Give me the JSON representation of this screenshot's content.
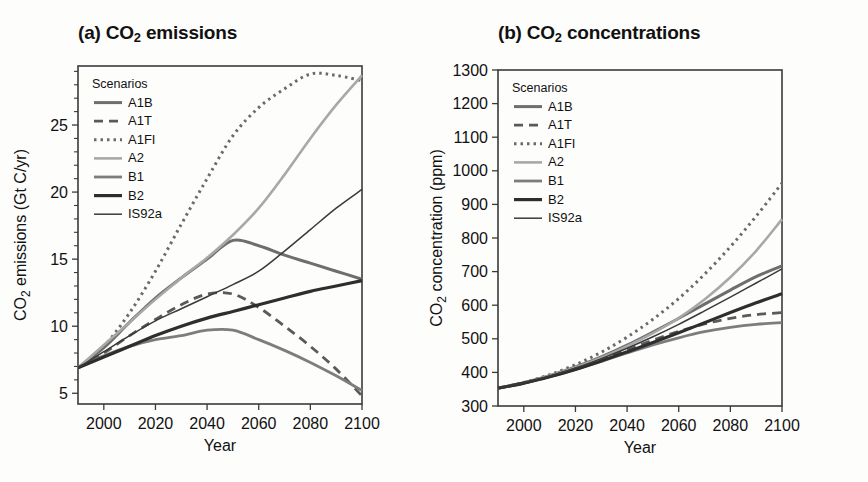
{
  "figure": {
    "background": "#fdfdfc",
    "panels": [
      {
        "id": "a",
        "title_prefix": "(a) CO",
        "title_sub": "2",
        "title_suffix": " emissions",
        "title_full": "(a) CO2 emissions",
        "legend_title": "Scenarios"
      },
      {
        "id": "b",
        "title_prefix": "(b) CO",
        "title_sub": "2",
        "title_suffix": " concentrations",
        "title_full": "(b) CO2 concentrations",
        "legend_title": "Scenarios"
      }
    ]
  },
  "scenarios": [
    {
      "name": "A1B",
      "color": "#6e6e6e",
      "width": 3.0,
      "dash": "none"
    },
    {
      "name": "A1T",
      "color": "#5a5a5a",
      "width": 2.8,
      "dash": "9,6"
    },
    {
      "name": "A1FI",
      "color": "#6a6a6a",
      "width": 3.0,
      "dash": "2.5,4"
    },
    {
      "name": "A2",
      "color": "#a8a8a8",
      "width": 2.6,
      "dash": "none"
    },
    {
      "name": "B1",
      "color": "#7d7d7d",
      "width": 2.8,
      "dash": "none"
    },
    {
      "name": "B2",
      "color": "#2e2e2e",
      "width": 3.2,
      "dash": "none"
    },
    {
      "name": "IS92a",
      "color": "#3a3a3a",
      "width": 1.5,
      "dash": "none"
    }
  ],
  "chart_data": [
    {
      "type": "line",
      "panel": "a",
      "title": "(a) CO2 emissions",
      "xlabel": "Year",
      "ylabel": "CO2 emissions (Gt C/yr)",
      "ylabel_prefix": "CO",
      "ylabel_sub": "2",
      "ylabel_suffix": " emissions (Gt C/yr)",
      "xlim": [
        1990,
        2100
      ],
      "ylim": [
        4.2,
        29.4
      ],
      "xticks": [
        2000,
        2020,
        2040,
        2060,
        2080,
        2100
      ],
      "yticks": [
        5,
        10,
        15,
        20,
        25
      ],
      "yminor_step": 1,
      "grid": false,
      "legend_position": "top-left",
      "x": [
        1990,
        2000,
        2010,
        2020,
        2030,
        2040,
        2050,
        2060,
        2070,
        2080,
        2090,
        2100
      ],
      "series": [
        {
          "name": "A1B",
          "values": [
            6.9,
            8.4,
            10.3,
            12.1,
            13.6,
            15.0,
            16.4,
            16.0,
            15.3,
            14.7,
            14.1,
            13.5
          ]
        },
        {
          "name": "A1T",
          "values": [
            6.9,
            8.0,
            9.3,
            10.5,
            11.6,
            12.4,
            12.4,
            11.4,
            10.0,
            8.5,
            6.8,
            4.8
          ]
        },
        {
          "name": "A1FI",
          "values": [
            6.9,
            8.5,
            11.0,
            14.1,
            17.6,
            21.0,
            24.2,
            26.3,
            27.7,
            28.8,
            28.7,
            28.3
          ]
        },
        {
          "name": "A2",
          "values": [
            6.9,
            8.6,
            10.3,
            12.0,
            13.6,
            15.1,
            16.8,
            18.8,
            21.3,
            24.0,
            26.5,
            28.7
          ]
        },
        {
          "name": "B1",
          "values": [
            6.9,
            7.8,
            8.5,
            9.0,
            9.3,
            9.7,
            9.7,
            9.0,
            8.2,
            7.3,
            6.3,
            5.2
          ]
        },
        {
          "name": "B2",
          "values": [
            6.9,
            7.7,
            8.5,
            9.3,
            10.0,
            10.6,
            11.1,
            11.6,
            12.1,
            12.6,
            13.0,
            13.4
          ]
        },
        {
          "name": "IS92a",
          "values": [
            6.9,
            8.1,
            9.3,
            10.4,
            11.3,
            12.2,
            13.1,
            14.1,
            15.6,
            17.2,
            18.8,
            20.2
          ]
        }
      ]
    },
    {
      "type": "line",
      "panel": "b",
      "title": "(b) CO2 concentrations",
      "xlabel": "Year",
      "ylabel": "CO2 concentration (ppm)",
      "ylabel_prefix": "CO",
      "ylabel_sub": "2",
      "ylabel_suffix": " concentration (ppm)",
      "xlim": [
        1990,
        2100
      ],
      "ylim": [
        300,
        1300
      ],
      "xticks": [
        2000,
        2020,
        2040,
        2060,
        2080,
        2100
      ],
      "yticks": [
        300,
        400,
        500,
        600,
        700,
        800,
        900,
        1000,
        1100,
        1200,
        1300
      ],
      "grid": false,
      "legend_position": "top-left",
      "x": [
        1990,
        2000,
        2010,
        2020,
        2030,
        2040,
        2050,
        2060,
        2070,
        2080,
        2090,
        2100
      ],
      "series": [
        {
          "name": "A1B",
          "values": [
            353,
            369,
            390,
            416,
            446,
            481,
            520,
            561,
            603,
            645,
            685,
            717
          ]
        },
        {
          "name": "A1T",
          "values": [
            353,
            368,
            388,
            411,
            438,
            467,
            496,
            522,
            544,
            561,
            572,
            578
          ]
        },
        {
          "name": "A1FI",
          "values": [
            353,
            370,
            393,
            423,
            460,
            505,
            558,
            620,
            692,
            774,
            865,
            963
          ]
        },
        {
          "name": "A2",
          "values": [
            353,
            369,
            390,
            415,
            444,
            478,
            517,
            562,
            617,
            683,
            762,
            856
          ]
        },
        {
          "name": "B1",
          "values": [
            353,
            368,
            387,
            409,
            433,
            458,
            482,
            503,
            521,
            534,
            543,
            548
          ]
        },
        {
          "name": "B2",
          "values": [
            353,
            368,
            387,
            409,
            434,
            461,
            489,
            518,
            548,
            578,
            607,
            634
          ]
        },
        {
          "name": "IS92a",
          "values": [
            353,
            369,
            389,
            413,
            441,
            472,
            506,
            543,
            583,
            624,
            666,
            708
          ]
        }
      ]
    }
  ]
}
